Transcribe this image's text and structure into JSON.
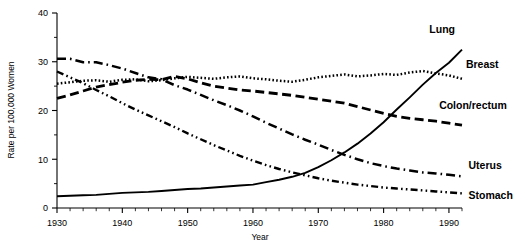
{
  "chart_data": {
    "type": "line",
    "title": "",
    "xlabel": "Year",
    "ylabel": "Rate per 100,000 Women",
    "xlim": [
      1930,
      1992
    ],
    "ylim": [
      0,
      40
    ],
    "xticks": [
      1930,
      1940,
      1950,
      1960,
      1970,
      1980,
      1990
    ],
    "yticks": [
      0,
      10,
      20,
      30,
      40
    ],
    "xtick_labels": [
      "1930",
      "1940",
      "1950",
      "1960",
      "1970",
      "1980",
      "1990"
    ],
    "ytick_labels": [
      "0",
      "10",
      "20",
      "30",
      "40"
    ],
    "minor_xtick_interval": 2,
    "minor_ytick_interval": 5,
    "grid": false,
    "legend_position": "inline-right",
    "x": [
      1930,
      1932,
      1934,
      1936,
      1938,
      1940,
      1942,
      1944,
      1946,
      1948,
      1950,
      1952,
      1954,
      1956,
      1958,
      1960,
      1962,
      1964,
      1966,
      1968,
      1970,
      1972,
      1974,
      1976,
      1978,
      1980,
      1982,
      1984,
      1986,
      1988,
      1990,
      1992
    ],
    "series": [
      {
        "name": "Lung",
        "label": "Lung",
        "style": "solid",
        "color": "#000000",
        "values": [
          2.4,
          2.5,
          2.6,
          2.7,
          2.9,
          3.1,
          3.2,
          3.3,
          3.5,
          3.7,
          3.9,
          4.0,
          4.2,
          4.4,
          4.6,
          4.8,
          5.3,
          5.8,
          6.4,
          7.2,
          8.4,
          9.8,
          11.4,
          13.2,
          15.3,
          17.6,
          20.2,
          22.7,
          25.3,
          27.7,
          29.8,
          32.5
        ]
      },
      {
        "name": "Breast",
        "label": "Breast",
        "style": "dotted",
        "color": "#000000",
        "values": [
          25.5,
          25.8,
          26.1,
          26.2,
          25.9,
          26.3,
          26.4,
          26.0,
          26.2,
          26.6,
          26.9,
          26.7,
          26.5,
          26.8,
          27.0,
          26.6,
          26.4,
          26.1,
          25.9,
          26.3,
          26.8,
          27.1,
          27.4,
          27.0,
          27.2,
          27.5,
          27.3,
          27.8,
          28.1,
          27.6,
          27.2,
          26.5
        ]
      },
      {
        "name": "Colon/rectum",
        "label": "Colon/rectum",
        "style": "dashed",
        "color": "#000000",
        "values": [
          22.5,
          23.2,
          24.0,
          24.8,
          25.3,
          25.8,
          26.2,
          26.4,
          26.3,
          27.0,
          26.5,
          25.7,
          25.0,
          24.6,
          24.2,
          24.0,
          23.7,
          23.4,
          23.1,
          22.7,
          22.3,
          21.9,
          21.5,
          20.8,
          20.1,
          19.4,
          18.8,
          18.4,
          18.1,
          17.8,
          17.4,
          17.0
        ]
      },
      {
        "name": "Uterus",
        "label": "Uterus",
        "style": "dashdot",
        "color": "#000000",
        "values": [
          30.6,
          30.6,
          29.9,
          29.9,
          29.3,
          28.6,
          27.7,
          26.8,
          26.4,
          25.2,
          24.3,
          23.2,
          22.1,
          21.1,
          20.0,
          18.8,
          17.5,
          16.3,
          15.1,
          14.0,
          13.0,
          11.9,
          10.9,
          10.0,
          9.2,
          8.6,
          8.1,
          7.7,
          7.3,
          7.1,
          6.8,
          6.5
        ]
      },
      {
        "name": "Stomach",
        "label": "Stomach",
        "style": "dashdotdot",
        "color": "#000000",
        "values": [
          28.0,
          26.8,
          25.6,
          24.2,
          22.9,
          21.5,
          20.2,
          19.0,
          17.8,
          16.6,
          15.3,
          14.1,
          12.9,
          11.8,
          10.7,
          9.7,
          8.8,
          8.0,
          7.3,
          6.7,
          6.1,
          5.6,
          5.2,
          4.8,
          4.5,
          4.2,
          4.0,
          3.8,
          3.6,
          3.4,
          3.2,
          3.0
        ]
      }
    ],
    "annotations": [
      {
        "text": "Lung",
        "x": 1987.0,
        "y": 36.0
      },
      {
        "text": "Breast",
        "x": 1992.6,
        "y": 28.8
      },
      {
        "text": "Colon/rectum",
        "x": 1988.5,
        "y": 20.4
      },
      {
        "text": "Uterus",
        "x": 1993.0,
        "y": 7.9
      },
      {
        "text": "Stomach",
        "x": 1993.0,
        "y": 1.9
      }
    ]
  }
}
